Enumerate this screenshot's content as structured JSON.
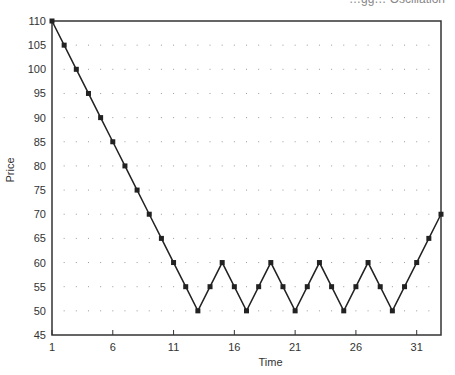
{
  "chart_data": {
    "type": "line",
    "title": "…gg… Oscillation",
    "xlabel": "Time",
    "ylabel": "Price",
    "xlim": [
      1,
      33
    ],
    "ylim": [
      45,
      110
    ],
    "x_ticks": [
      1,
      6,
      11,
      16,
      21,
      26,
      31
    ],
    "y_ticks": [
      45,
      50,
      55,
      60,
      65,
      70,
      75,
      80,
      85,
      90,
      95,
      100,
      105,
      110
    ],
    "grid": "dotted",
    "legend": null,
    "series": [
      {
        "name": "Price",
        "marker": "square",
        "color": "#222222",
        "x": [
          1,
          2,
          3,
          4,
          5,
          6,
          7,
          8,
          9,
          10,
          11,
          12,
          13,
          14,
          15,
          16,
          17,
          18,
          19,
          20,
          21,
          22,
          23,
          24,
          25,
          26,
          27,
          28,
          29,
          30,
          31,
          32,
          33
        ],
        "values": [
          110,
          105,
          100,
          95,
          90,
          85,
          80,
          75,
          70,
          65,
          60,
          55,
          50,
          55,
          60,
          55,
          50,
          55,
          60,
          55,
          50,
          55,
          60,
          55,
          50,
          55,
          60,
          55,
          50,
          55,
          60,
          65,
          70
        ]
      }
    ]
  },
  "header": {
    "title_fragment": "…gg… Oscillation"
  }
}
